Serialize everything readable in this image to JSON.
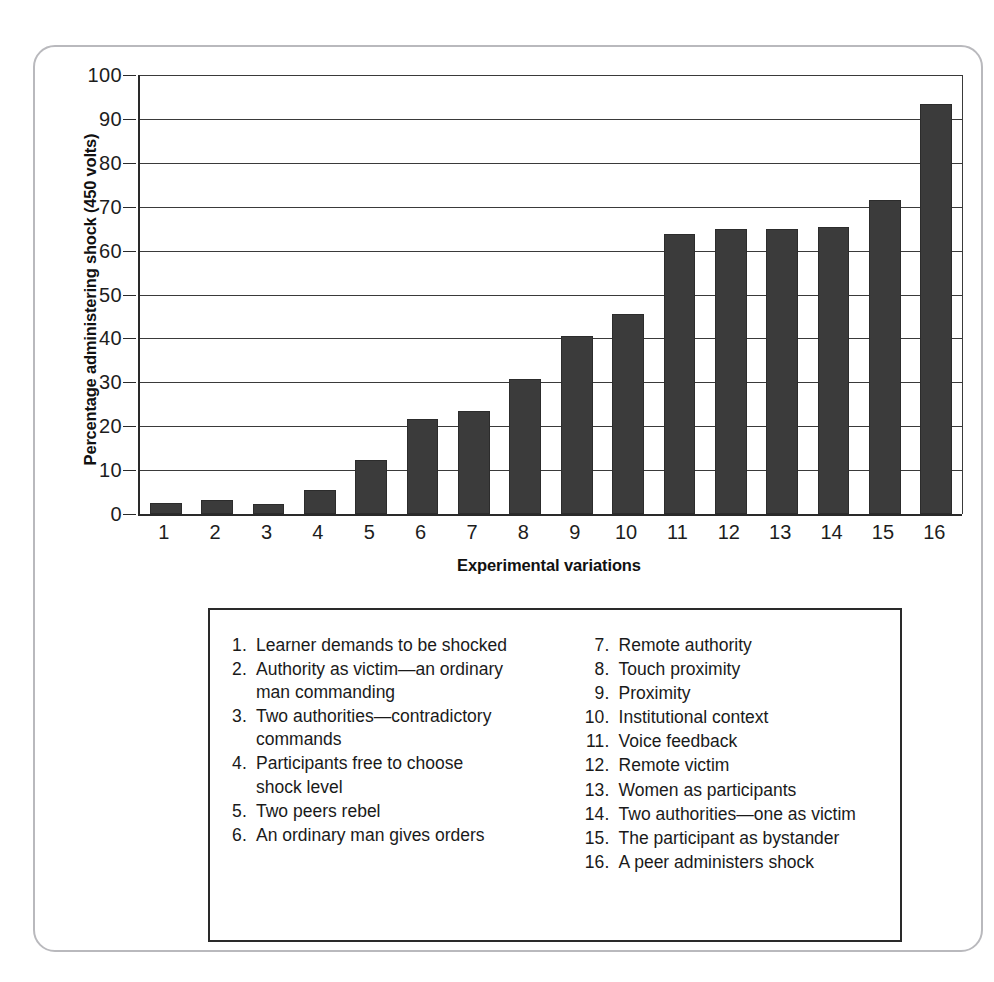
{
  "chart_data": {
    "type": "bar",
    "title": "",
    "xlabel": "Experimental variations",
    "ylabel": "Percentage administering shock (450 volts)",
    "categories": [
      "1",
      "2",
      "3",
      "4",
      "5",
      "6",
      "7",
      "8",
      "9",
      "10",
      "11",
      "12",
      "13",
      "14",
      "15",
      "16"
    ],
    "values": [
      2.5,
      3.3,
      2.2,
      5.5,
      12.3,
      21.7,
      23.5,
      30.7,
      40.5,
      45.5,
      63.7,
      65.0,
      65.0,
      65.3,
      71.5,
      93.5
    ],
    "ylim": [
      0,
      100
    ],
    "yticks": [
      "0",
      "10",
      "20",
      "30",
      "40",
      "50",
      "60",
      "70",
      "80",
      "90",
      "100"
    ],
    "grid": "horizontal",
    "legend_position": "below",
    "bar_color": "#3b3b3b",
    "axis_color": "#2a2a2a",
    "background_color": "#ffffff"
  },
  "legend": {
    "left_column": [
      {
        "num": "1.",
        "label": "Learner demands to be shocked"
      },
      {
        "num": "2.",
        "label": "Authority as victim—an ordinary man commanding"
      },
      {
        "num": "3.",
        "label": "Two authorities—contradictory commands"
      },
      {
        "num": "4.",
        "label": "Participants free to choose shock level"
      },
      {
        "num": "5.",
        "label": "Two peers rebel"
      },
      {
        "num": "6.",
        "label": "An ordinary man gives orders"
      }
    ],
    "right_column": [
      {
        "num": "7.",
        "label": "Remote authority"
      },
      {
        "num": "8.",
        "label": "Touch proximity"
      },
      {
        "num": "9.",
        "label": "Proximity"
      },
      {
        "num": "10.",
        "label": "Institutional context"
      },
      {
        "num": "11.",
        "label": "Voice feedback"
      },
      {
        "num": "12.",
        "label": "Remote victim"
      },
      {
        "num": "13.",
        "label": "Women as participants"
      },
      {
        "num": "14.",
        "label": "Two authorities—one as victim"
      },
      {
        "num": "15.",
        "label": "The participant as bystander"
      },
      {
        "num": "16.",
        "label": "A peer administers shock"
      }
    ]
  }
}
